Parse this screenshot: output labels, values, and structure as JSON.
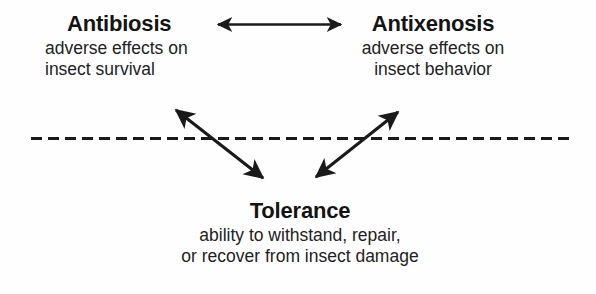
{
  "diagram": {
    "background_color": "#fefefe",
    "ink_color": "#1a1a1a",
    "nodes": [
      {
        "id": "antibiosis",
        "title": "Antibiosis",
        "description_lines": [
          "adverse effects on",
          "insect survival"
        ],
        "align": "left"
      },
      {
        "id": "antixenosis",
        "title": "Antixenosis",
        "description_lines": [
          "adverse effects on",
          "insect behavior"
        ],
        "align": "center"
      },
      {
        "id": "tolerance",
        "title": "Tolerance",
        "description_lines": [
          "ability to withstand, repair,",
          "or recover from insect damage"
        ],
        "align": "center"
      }
    ],
    "connectors": [
      {
        "id": "antibiosis-antixenosis",
        "name": "horizontal-double-arrow",
        "from": "antibiosis",
        "to": "antixenosis",
        "heads": "both",
        "orientation": "horizontal"
      },
      {
        "id": "antibiosis-tolerance",
        "name": "left-diagonal-double-arrow",
        "from": "antibiosis",
        "to": "tolerance",
        "heads": "both",
        "orientation": "diagonal-down-right"
      },
      {
        "id": "antixenosis-tolerance",
        "name": "right-diagonal-double-arrow",
        "from": "antixenosis",
        "to": "tolerance",
        "heads": "both",
        "orientation": "diagonal-up-right"
      }
    ],
    "divider": {
      "id": "dashed-divider",
      "style": "dashed",
      "orientation": "horizontal",
      "dash_length": 11,
      "gap_length": 6,
      "thickness": 3
    }
  }
}
